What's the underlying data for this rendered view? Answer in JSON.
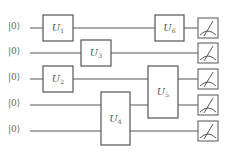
{
  "diagram": {
    "type": "quantum-circuit",
    "qubits": [
      {
        "label": "|0⟩",
        "y": 28
      },
      {
        "label": "|0⟩",
        "y": 53
      },
      {
        "label": "|0⟩",
        "y": 79
      },
      {
        "label": "|0⟩",
        "y": 105
      },
      {
        "label": "|0⟩",
        "y": 131
      }
    ],
    "gates": [
      {
        "name": "U",
        "sub": "1",
        "x": 43,
        "y": 15,
        "w": 30,
        "h": 26,
        "qubits": [
          0
        ]
      },
      {
        "name": "U",
        "sub": "3",
        "x": 81,
        "y": 40,
        "w": 30,
        "h": 26,
        "qubits": [
          1
        ]
      },
      {
        "name": "U",
        "sub": "2",
        "x": 43,
        "y": 66,
        "w": 30,
        "h": 26,
        "qubits": [
          2
        ]
      },
      {
        "name": "U",
        "sub": "4",
        "x": 101,
        "y": 92,
        "w": 29,
        "h": 53,
        "qubits": [
          3,
          4
        ]
      },
      {
        "name": "U",
        "sub": "5",
        "x": 148,
        "y": 66,
        "w": 30,
        "h": 52,
        "qubits": [
          2,
          3
        ]
      },
      {
        "name": "U",
        "sub": "6",
        "x": 155,
        "y": 15,
        "w": 29,
        "h": 26,
        "qubits": [
          0
        ]
      }
    ],
    "measurements": [
      {
        "qubit": 0,
        "icon": "meter-icon"
      },
      {
        "qubit": 1,
        "icon": "meter-icon"
      },
      {
        "qubit": 2,
        "icon": "meter-icon"
      },
      {
        "qubit": 3,
        "icon": "meter-icon"
      },
      {
        "qubit": 4,
        "icon": "meter-icon"
      }
    ],
    "wire_start_x": 30,
    "wire_end_x": 198,
    "meter": {
      "x": 198,
      "size": 20
    },
    "colors": {
      "line": "#555555",
      "background": "#ffffff",
      "text": "#666666"
    }
  }
}
